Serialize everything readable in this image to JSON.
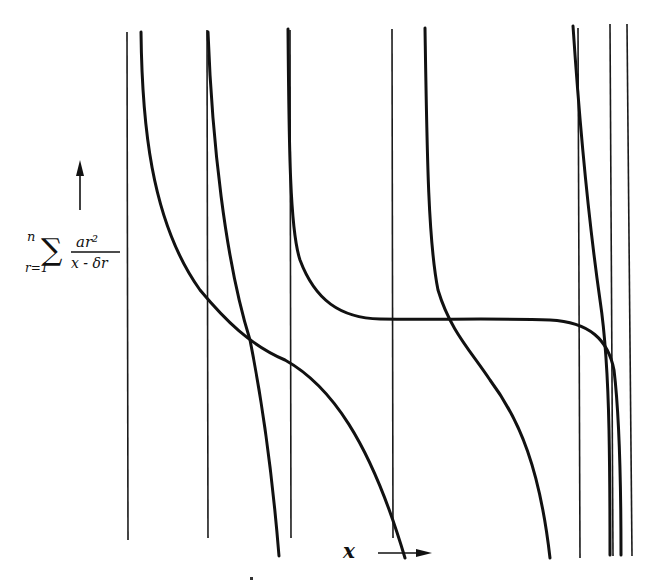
{
  "figure": {
    "type": "diagram",
    "y_axis_label": {
      "upper_limit": "n",
      "lower_limit": "r=1",
      "numerator": "ar²",
      "denominator": "x - δr"
    },
    "x_axis_label": "x",
    "colors": {
      "ink": "#111111",
      "background": "#ffffff"
    },
    "asymptotes_x": [
      127,
      207,
      290,
      392,
      578,
      610,
      625
    ],
    "bottom_cluster_x": [
      603,
      610,
      617,
      625
    ],
    "curves": [
      {
        "name": "branch-1",
        "d": "M141,32 C146,200 170,300 255,340 C300,360 330,380 405,558"
      },
      {
        "name": "branch-2",
        "d": "M207,32 L207,32 C214,210 240,330 278,550"
      },
      {
        "name": "branch-3",
        "d": "M287,29 C290,200 293,300 330,312 C360,322 420,318 560,318 C600,320 618,350 622,555"
      },
      {
        "name": "branch-4",
        "d": "M425,28 C428,200 430,300 470,360 C510,420 540,470 551,558"
      },
      {
        "name": "branch-5",
        "d": "M573,26 C585,170 598,280 608,360 C612,420 613,480 613,555"
      }
    ]
  }
}
